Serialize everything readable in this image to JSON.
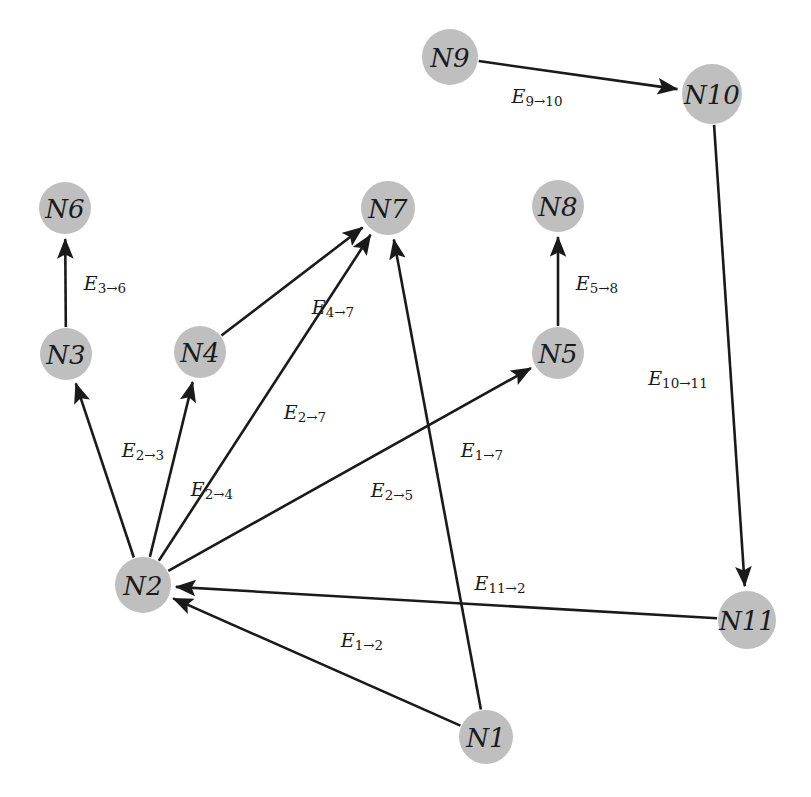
{
  "diagram": {
    "type": "directed-graph",
    "width": 811,
    "height": 797,
    "background_color": "#ffffff",
    "node_fill_color": "#bfbfbf",
    "edge_color": "#1a1a1a"
  },
  "nodes": [
    {
      "id": "N1",
      "label": "N1",
      "x": 486,
      "y": 737,
      "r": 27
    },
    {
      "id": "N2",
      "label": "N2",
      "x": 143,
      "y": 585,
      "r": 28
    },
    {
      "id": "N3",
      "label": "N3",
      "x": 66,
      "y": 354,
      "r": 26
    },
    {
      "id": "N4",
      "label": "N4",
      "x": 200,
      "y": 352,
      "r": 26
    },
    {
      "id": "N5",
      "label": "N5",
      "x": 558,
      "y": 353,
      "r": 26
    },
    {
      "id": "N6",
      "label": "N6",
      "x": 65,
      "y": 208,
      "r": 26
    },
    {
      "id": "N7",
      "label": "N7",
      "x": 388,
      "y": 208,
      "r": 27
    },
    {
      "id": "N8",
      "label": "N8",
      "x": 558,
      "y": 206,
      "r": 26
    },
    {
      "id": "N9",
      "label": "N9",
      "x": 450,
      "y": 57,
      "r": 28
    },
    {
      "id": "N10",
      "label": "N10",
      "x": 712,
      "y": 94,
      "r": 30
    },
    {
      "id": "N11",
      "label": "N11",
      "x": 747,
      "y": 620,
      "r": 29
    }
  ],
  "edges": [
    {
      "id": "E9_10",
      "from": "N9",
      "to": "N10",
      "label_main": "E",
      "label_sub": "9→10",
      "label_x": 537,
      "label_y": 96
    },
    {
      "id": "E10_11",
      "from": "N10",
      "to": "N11",
      "label_main": "E",
      "label_sub": "10→11",
      "label_x": 678,
      "label_y": 378
    },
    {
      "id": "E11_2",
      "from": "N11",
      "to": "N2",
      "label_main": "E",
      "label_sub": "11→2",
      "label_x": 500,
      "label_y": 583
    },
    {
      "id": "E3_6",
      "from": "N3",
      "to": "N6",
      "label_main": "E",
      "label_sub": "3→6",
      "label_x": 105,
      "label_y": 283
    },
    {
      "id": "E5_8",
      "from": "N5",
      "to": "N8",
      "label_main": "E",
      "label_sub": "5→8",
      "label_x": 597,
      "label_y": 283
    },
    {
      "id": "E2_3",
      "from": "N2",
      "to": "N3",
      "label_main": "E",
      "label_sub": "2→3",
      "label_x": 143,
      "label_y": 450
    },
    {
      "id": "E2_4",
      "from": "N2",
      "to": "N4",
      "label_main": "E",
      "label_sub": "2→4",
      "label_x": 212,
      "label_y": 489
    },
    {
      "id": "E2_7",
      "from": "N2",
      "to": "N7",
      "label_main": "E",
      "label_sub": "2→7",
      "label_x": 305,
      "label_y": 412
    },
    {
      "id": "E2_5",
      "from": "N2",
      "to": "N5",
      "label_main": "E",
      "label_sub": "2→5",
      "label_x": 392,
      "label_y": 490
    },
    {
      "id": "E4_7",
      "from": "N4",
      "to": "N7",
      "label_main": "E",
      "label_sub": "4→7",
      "label_x": 333,
      "label_y": 307
    },
    {
      "id": "E1_7",
      "from": "N1",
      "to": "N7",
      "label_main": "E",
      "label_sub": "1→7",
      "label_x": 482,
      "label_y": 450
    },
    {
      "id": "E1_2",
      "from": "N1",
      "to": "N2",
      "label_main": "E",
      "label_sub": "1→2",
      "label_x": 362,
      "label_y": 640
    }
  ]
}
